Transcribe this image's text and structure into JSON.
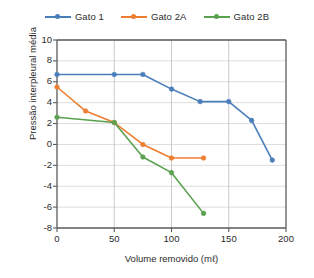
{
  "chart_data": {
    "type": "line",
    "title": "",
    "xlabel": "Volume removido (mℓ)",
    "ylabel": "Pressão interpleural média",
    "xlim": [
      0,
      200
    ],
    "ylim": [
      -8,
      10
    ],
    "xticks": [
      0,
      50,
      100,
      150,
      200
    ],
    "yticks": [
      10,
      8,
      6,
      4,
      2,
      0,
      -2,
      -4,
      -6,
      -8
    ],
    "xtick_labels": [
      "0",
      "50",
      "100",
      "150",
      "200"
    ],
    "ytick_labels": [
      "10",
      "8",
      "6",
      "4",
      "2",
      "0",
      "-2",
      "-4",
      "-6",
      "-8"
    ],
    "grid": "horizontal-and-vertical",
    "legend_position": "top-center",
    "series": [
      {
        "name": "Gato 1",
        "color": "#4a7ebb",
        "x": [
          0,
          50,
          75,
          100,
          125,
          150,
          170,
          188
        ],
        "values": [
          6.7,
          6.7,
          6.7,
          5.3,
          4.1,
          4.1,
          2.3,
          -1.5
        ]
      },
      {
        "name": "Gato 2A",
        "color": "#ed7d31",
        "x": [
          0,
          25,
          50,
          75,
          100,
          128
        ],
        "values": [
          5.5,
          3.2,
          2.1,
          0.0,
          -1.3,
          -1.3
        ]
      },
      {
        "name": "Gato 2B",
        "color": "#5aa150",
        "x": [
          0,
          50,
          75,
          100,
          128
        ],
        "values": [
          2.6,
          2.1,
          -1.2,
          -2.7,
          -6.6
        ]
      }
    ]
  },
  "legend": {
    "entries": [
      {
        "label": "Gato 1"
      },
      {
        "label": "Gato 2A"
      },
      {
        "label": "Gato 2B"
      }
    ]
  },
  "axes": {
    "x_label": "Volume removido (mℓ)",
    "y_label": "Pressão interpleural média"
  }
}
